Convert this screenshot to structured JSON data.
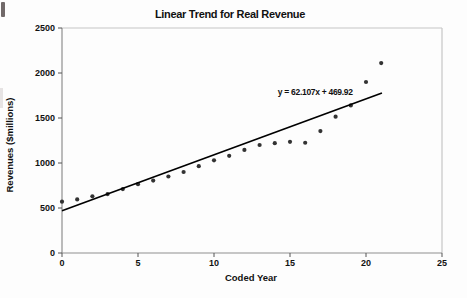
{
  "chart_data": {
    "type": "scatter",
    "title": "Linear Trend for Real Revenue",
    "xlabel": "Coded Year",
    "ylabel": "Revenues ($millions)",
    "xlim": [
      0,
      25
    ],
    "ylim": [
      0,
      2500
    ],
    "xticks": [
      0,
      5,
      10,
      15,
      20,
      25
    ],
    "yticks": [
      0,
      500,
      1000,
      1500,
      2000,
      2500
    ],
    "grid": false,
    "legend": false,
    "x": [
      0,
      1,
      2,
      3,
      4,
      5,
      6,
      7,
      8,
      9,
      10,
      11,
      12,
      13,
      14,
      15,
      16,
      17,
      18,
      19,
      20,
      21
    ],
    "y": [
      570,
      595,
      630,
      655,
      710,
      765,
      805,
      850,
      900,
      965,
      1030,
      1080,
      1145,
      1200,
      1220,
      1235,
      1225,
      1355,
      1515,
      1640,
      1900,
      2110
    ],
    "trendline": {
      "label": "y = 62.107x + 469.92",
      "slope": 62.107,
      "intercept": 469.92,
      "x_start": 0,
      "x_end": 21.05,
      "label_x": 14.2,
      "label_y": 1760
    },
    "colors": {
      "marker": "#333333",
      "trend_line": "#000000",
      "axis": "#8f8f8f",
      "tick": "#555555",
      "frame": "#c6c6c6",
      "text": "#111111"
    }
  }
}
